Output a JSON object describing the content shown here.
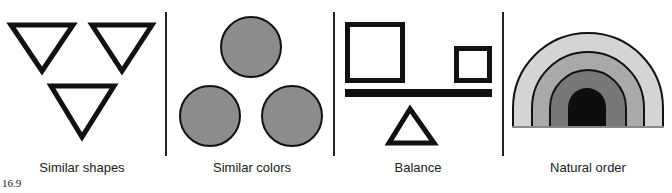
{
  "figure": {
    "number": "16.9",
    "panels": [
      {
        "id": "similar-shapes",
        "label": "Similar shapes",
        "content": "three inverted outline triangles"
      },
      {
        "id": "similar-colors",
        "label": "Similar colors",
        "content": "three gray filled circles"
      },
      {
        "id": "balance",
        "label": "Balance",
        "content": "large square and small square on a bar balanced on a triangle fulcrum"
      },
      {
        "id": "natural-order",
        "label": "Natural order",
        "content": "nested arches graded from light gray to black"
      }
    ],
    "colors": {
      "stroke": "#111111",
      "circle_fill": "#8c8c8c",
      "arch_1": "#d4d4d4",
      "arch_2": "#a9a9a9",
      "arch_3": "#787878",
      "arch_4": "#0e0e0e"
    }
  }
}
